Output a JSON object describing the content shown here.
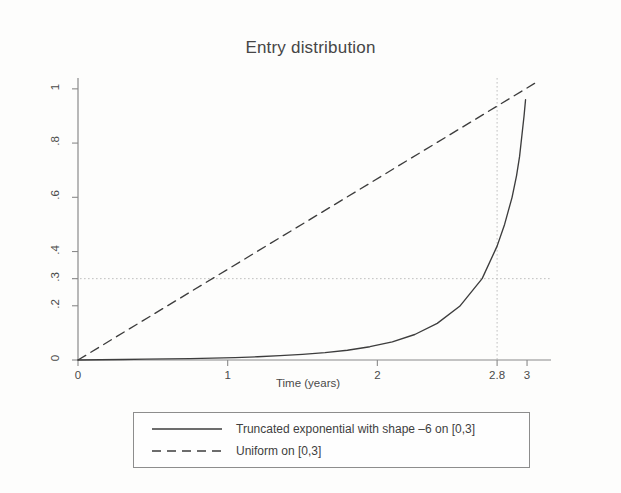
{
  "chart_data": {
    "type": "line",
    "title": "Entry distribution",
    "xlabel": "Time (years)",
    "ylabel": "Proportion accrued",
    "xlim": [
      0,
      3.12
    ],
    "ylim": [
      0,
      1.04
    ],
    "xticks": [
      0,
      1,
      2,
      2.8,
      3
    ],
    "xticklabels": [
      "0",
      "1",
      "2",
      "2.8",
      "3"
    ],
    "yticks": [
      0,
      0.2,
      0.3,
      0.4,
      0.6,
      0.8,
      1
    ],
    "yticklabels": [
      "0",
      ".2",
      ".3",
      ".4",
      ".6",
      ".8",
      "1"
    ],
    "grid": false,
    "legend_position": "below-plot",
    "reference_lines": [
      {
        "name": "hline-0.3",
        "orientation": "horizontal",
        "value": 0.3,
        "style": "dotted"
      },
      {
        "name": "vline-2.8",
        "orientation": "vertical",
        "value": 2.8,
        "style": "dotted"
      }
    ],
    "series": [
      {
        "name": "Truncated exponential with shape –6 on [0,3]",
        "style": "solid",
        "color": "#3d3d3d",
        "x": [
          0,
          0.15,
          0.3,
          0.45,
          0.6,
          0.75,
          0.9,
          1.05,
          1.2,
          1.35,
          1.5,
          1.65,
          1.8,
          1.95,
          2.1,
          2.25,
          2.4,
          2.55,
          2.7,
          2.8,
          2.85,
          2.9,
          2.93,
          2.95,
          2.97,
          2.98,
          2.99
        ],
        "y": [
          0,
          0.001,
          0.002,
          0.003,
          0.004,
          0.005,
          0.007,
          0.009,
          0.012,
          0.016,
          0.021,
          0.027,
          0.036,
          0.049,
          0.067,
          0.094,
          0.135,
          0.198,
          0.3,
          0.42,
          0.5,
          0.6,
          0.68,
          0.75,
          0.85,
          0.9,
          0.96
        ]
      },
      {
        "name": "Uniform on [0,3]",
        "style": "dashed",
        "color": "#3d3d3d",
        "x": [
          0,
          3.05
        ],
        "y": [
          0,
          1.02
        ]
      }
    ],
    "annotations": [
      {
        "name": "crossing-point",
        "text": "Truncated exponential reaches 0.3 at t = 2.8",
        "x": 2.8,
        "y": 0.3
      }
    ]
  },
  "legend": {
    "entries": [
      {
        "label": "Truncated exponential with shape –6 on [0,3]",
        "style": "solid"
      },
      {
        "label": "Uniform on [0,3]",
        "style": "dashed"
      }
    ]
  }
}
